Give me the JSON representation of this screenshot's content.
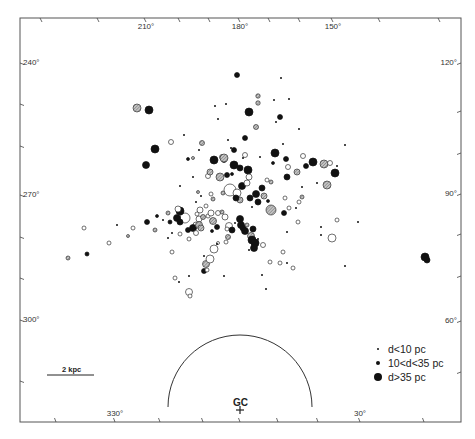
{
  "chart_data": {
    "type": "scatter",
    "title": "",
    "frame": {
      "left": 20,
      "top": 18,
      "right": 461,
      "bottom": 422
    },
    "axis_labels": {
      "top": [
        {
          "text": "210°",
          "x": 146
        },
        {
          "text": "180°",
          "x": 240
        },
        {
          "text": "150°",
          "x": 333
        }
      ],
      "bottom": [
        {
          "text": "330°",
          "x": 115
        },
        {
          "text": "30°",
          "x": 360
        }
      ],
      "left": [
        {
          "text": "240°",
          "y": 63
        },
        {
          "text": "270°",
          "y": 195
        },
        {
          "text": "300°",
          "y": 320
        }
      ],
      "right": [
        {
          "text": "120°",
          "y": 63
        },
        {
          "text": "90°",
          "y": 194
        },
        {
          "text": "60°",
          "y": 321
        }
      ]
    },
    "ticks": {
      "top": [
        42,
        99,
        146,
        180,
        210,
        240,
        270,
        300,
        333,
        380,
        440
      ],
      "bottom": [
        56,
        115,
        160,
        203,
        240,
        278,
        318,
        360,
        424
      ],
      "left": [
        63,
        104,
        146,
        195,
        237,
        278,
        320,
        381
      ],
      "right": [
        63,
        111,
        153,
        194,
        234,
        276,
        321,
        372
      ]
    },
    "legend": {
      "position": "lower-right",
      "entries": [
        {
          "marker": "tiny-dot",
          "label": "d<10 pc"
        },
        {
          "marker": "small-dot",
          "label": "10<d<35 pc"
        },
        {
          "marker": "large-dot",
          "label": "d>35 pc"
        }
      ]
    },
    "scale_bar": {
      "label": "2 kpc",
      "x1": 47,
      "x2": 94,
      "y": 375
    },
    "galactic_centre": {
      "label": "GC",
      "x": 240,
      "y": 410,
      "arc_radius": 72
    },
    "marker_styles": {
      "solid": "#111111",
      "hatched": "#a8a8a8",
      "open": "#ffffff"
    },
    "points": [
      {
        "x": 237,
        "y": 75,
        "r": 2.5,
        "s": "solid"
      },
      {
        "x": 281,
        "y": 78,
        "r": 1,
        "s": "solid"
      },
      {
        "x": 258,
        "y": 96,
        "r": 2.2,
        "s": "hatched"
      },
      {
        "x": 258,
        "y": 103,
        "r": 2.2,
        "s": "hatched"
      },
      {
        "x": 137,
        "y": 108,
        "r": 4,
        "s": "hatched"
      },
      {
        "x": 149,
        "y": 110,
        "r": 4,
        "s": "solid"
      },
      {
        "x": 215,
        "y": 106,
        "r": 1,
        "s": "solid"
      },
      {
        "x": 226,
        "y": 104,
        "r": 1,
        "s": "solid"
      },
      {
        "x": 274,
        "y": 100,
        "r": 1,
        "s": "solid"
      },
      {
        "x": 289,
        "y": 99,
        "r": 1,
        "s": "solid"
      },
      {
        "x": 249,
        "y": 112,
        "r": 4,
        "s": "solid"
      },
      {
        "x": 218,
        "y": 119,
        "r": 1,
        "s": "solid"
      },
      {
        "x": 280,
        "y": 117,
        "r": 2.5,
        "s": "solid"
      },
      {
        "x": 276,
        "y": 122,
        "r": 1,
        "s": "solid"
      },
      {
        "x": 256,
        "y": 127,
        "r": 2.5,
        "s": "hatched"
      },
      {
        "x": 299,
        "y": 129,
        "r": 1,
        "s": "solid"
      },
      {
        "x": 184,
        "y": 135,
        "r": 1,
        "s": "solid"
      },
      {
        "x": 245,
        "y": 138,
        "r": 2.5,
        "s": "solid"
      },
      {
        "x": 171,
        "y": 142,
        "r": 2.5,
        "s": "open"
      },
      {
        "x": 202,
        "y": 143,
        "r": 2.5,
        "s": "hatched"
      },
      {
        "x": 155,
        "y": 149,
        "r": 4,
        "s": "solid"
      },
      {
        "x": 283,
        "y": 144,
        "r": 1,
        "s": "solid"
      },
      {
        "x": 228,
        "y": 140,
        "r": 1,
        "s": "solid"
      },
      {
        "x": 231,
        "y": 148,
        "r": 1,
        "s": "solid"
      },
      {
        "x": 234,
        "y": 150,
        "r": 2.5,
        "s": "solid"
      },
      {
        "x": 199,
        "y": 150,
        "r": 1,
        "s": "solid"
      },
      {
        "x": 193,
        "y": 158,
        "r": 1.5,
        "s": "hatched"
      },
      {
        "x": 224,
        "y": 160,
        "r": 2.5,
        "s": "solid"
      },
      {
        "x": 222,
        "y": 157,
        "r": 2.5,
        "s": "open"
      },
      {
        "x": 224,
        "y": 158,
        "r": 4,
        "s": "hatched"
      },
      {
        "x": 214,
        "y": 160,
        "r": 4,
        "s": "solid"
      },
      {
        "x": 245,
        "y": 155,
        "r": 2.5,
        "s": "open"
      },
      {
        "x": 243,
        "y": 158,
        "r": 1,
        "s": "solid"
      },
      {
        "x": 275,
        "y": 153,
        "r": 4,
        "s": "solid"
      },
      {
        "x": 286,
        "y": 159,
        "r": 2.5,
        "s": "solid"
      },
      {
        "x": 273,
        "y": 163,
        "r": 1.5,
        "s": "solid"
      },
      {
        "x": 260,
        "y": 157,
        "r": 1,
        "s": "solid"
      },
      {
        "x": 313,
        "y": 162,
        "r": 4,
        "s": "solid"
      },
      {
        "x": 324,
        "y": 164,
        "r": 4,
        "s": "hatched"
      },
      {
        "x": 146,
        "y": 165,
        "r": 3.5,
        "s": "solid"
      },
      {
        "x": 188,
        "y": 159,
        "r": 1.5,
        "s": "solid"
      },
      {
        "x": 220,
        "y": 177,
        "r": 4,
        "s": "hatched"
      },
      {
        "x": 227,
        "y": 175,
        "r": 2.5,
        "s": "solid"
      },
      {
        "x": 208,
        "y": 176,
        "r": 2.5,
        "s": "open"
      },
      {
        "x": 210,
        "y": 172,
        "r": 3,
        "s": "hatched"
      },
      {
        "x": 232,
        "y": 174,
        "r": 1.5,
        "s": "solid"
      },
      {
        "x": 234,
        "y": 165,
        "r": 4,
        "s": "solid"
      },
      {
        "x": 248,
        "y": 170,
        "r": 4,
        "s": "solid"
      },
      {
        "x": 240,
        "y": 168,
        "r": 3,
        "s": "solid"
      },
      {
        "x": 249,
        "y": 177,
        "r": 3,
        "s": "open"
      },
      {
        "x": 267,
        "y": 180,
        "r": 2,
        "s": "open"
      },
      {
        "x": 271,
        "y": 182,
        "r": 2,
        "s": "hatched"
      },
      {
        "x": 288,
        "y": 167,
        "r": 2.5,
        "s": "open"
      },
      {
        "x": 297,
        "y": 172,
        "r": 3,
        "s": "hatched"
      },
      {
        "x": 287,
        "y": 177,
        "r": 3,
        "s": "solid"
      },
      {
        "x": 303,
        "y": 156,
        "r": 2.5,
        "s": "open"
      },
      {
        "x": 306,
        "y": 166,
        "r": 2.5,
        "s": "solid"
      },
      {
        "x": 330,
        "y": 163,
        "r": 2.5,
        "s": "open"
      },
      {
        "x": 337,
        "y": 166,
        "r": 1,
        "s": "solid"
      },
      {
        "x": 335,
        "y": 173,
        "r": 4,
        "s": "solid"
      },
      {
        "x": 345,
        "y": 145,
        "r": 1,
        "s": "solid"
      },
      {
        "x": 327,
        "y": 185,
        "r": 4,
        "s": "hatched"
      },
      {
        "x": 317,
        "y": 183,
        "r": 1,
        "s": "solid"
      },
      {
        "x": 230,
        "y": 190,
        "r": 6,
        "s": "open"
      },
      {
        "x": 237,
        "y": 193,
        "r": 4,
        "s": "open"
      },
      {
        "x": 242,
        "y": 186,
        "r": 3.5,
        "s": "solid"
      },
      {
        "x": 247,
        "y": 183,
        "r": 3,
        "s": "open"
      },
      {
        "x": 240,
        "y": 200,
        "r": 3,
        "s": "hatched"
      },
      {
        "x": 236,
        "y": 198,
        "r": 3,
        "s": "solid"
      },
      {
        "x": 250,
        "y": 198,
        "r": 3,
        "s": "solid"
      },
      {
        "x": 256,
        "y": 194,
        "r": 3.5,
        "s": "solid"
      },
      {
        "x": 258,
        "y": 202,
        "r": 3,
        "s": "solid"
      },
      {
        "x": 262,
        "y": 188,
        "r": 3,
        "s": "solid"
      },
      {
        "x": 264,
        "y": 196,
        "r": 3,
        "s": "hatched"
      },
      {
        "x": 268,
        "y": 201,
        "r": 1.5,
        "s": "solid"
      },
      {
        "x": 271,
        "y": 210,
        "r": 5,
        "s": "hatched"
      },
      {
        "x": 252,
        "y": 207,
        "r": 1,
        "s": "solid"
      },
      {
        "x": 223,
        "y": 193,
        "r": 2,
        "s": "hatched"
      },
      {
        "x": 211,
        "y": 194,
        "r": 2,
        "s": "open"
      },
      {
        "x": 213,
        "y": 199,
        "r": 2,
        "s": "hatched"
      },
      {
        "x": 198,
        "y": 192,
        "r": 1.5,
        "s": "hatched"
      },
      {
        "x": 201,
        "y": 196,
        "r": 1,
        "s": "solid"
      },
      {
        "x": 200,
        "y": 210,
        "r": 3,
        "s": "open"
      },
      {
        "x": 206,
        "y": 206,
        "r": 2,
        "s": "open"
      },
      {
        "x": 285,
        "y": 198,
        "r": 2,
        "s": "open"
      },
      {
        "x": 289,
        "y": 208,
        "r": 2,
        "s": "open"
      },
      {
        "x": 284,
        "y": 213,
        "r": 2.5,
        "s": "solid"
      },
      {
        "x": 296,
        "y": 208,
        "r": 1,
        "s": "solid"
      },
      {
        "x": 302,
        "y": 187,
        "r": 1,
        "s": "solid"
      },
      {
        "x": 302,
        "y": 197,
        "r": 2,
        "s": "hatched"
      },
      {
        "x": 299,
        "y": 202,
        "r": 2,
        "s": "open"
      },
      {
        "x": 196,
        "y": 225,
        "r": 3,
        "s": "open"
      },
      {
        "x": 185,
        "y": 218,
        "r": 5,
        "s": "open"
      },
      {
        "x": 180,
        "y": 211,
        "r": 4,
        "s": "solid"
      },
      {
        "x": 178,
        "y": 209,
        "r": 3,
        "s": "open"
      },
      {
        "x": 177,
        "y": 218,
        "r": 3.5,
        "s": "solid"
      },
      {
        "x": 180,
        "y": 222,
        "r": 3,
        "s": "solid"
      },
      {
        "x": 188,
        "y": 230,
        "r": 2.5,
        "s": "solid"
      },
      {
        "x": 193,
        "y": 228,
        "r": 3.5,
        "s": "solid"
      },
      {
        "x": 197,
        "y": 214,
        "r": 2,
        "s": "open"
      },
      {
        "x": 199,
        "y": 219,
        "r": 3,
        "s": "open"
      },
      {
        "x": 203,
        "y": 217,
        "r": 2.5,
        "s": "hatched"
      },
      {
        "x": 199,
        "y": 225,
        "r": 3.5,
        "s": "hatched"
      },
      {
        "x": 201,
        "y": 228,
        "r": 3,
        "s": "hatched"
      },
      {
        "x": 196,
        "y": 233,
        "r": 2.5,
        "s": "open"
      },
      {
        "x": 208,
        "y": 216,
        "r": 2,
        "s": "open"
      },
      {
        "x": 211,
        "y": 213,
        "r": 3,
        "s": "open"
      },
      {
        "x": 213,
        "y": 221,
        "r": 3.5,
        "s": "hatched"
      },
      {
        "x": 218,
        "y": 213,
        "r": 2.5,
        "s": "open"
      },
      {
        "x": 222,
        "y": 212,
        "r": 2,
        "s": "hatched"
      },
      {
        "x": 217,
        "y": 227,
        "r": 2.5,
        "s": "solid"
      },
      {
        "x": 225,
        "y": 217,
        "r": 3,
        "s": "open"
      },
      {
        "x": 212,
        "y": 231,
        "r": 1.5,
        "s": "solid"
      },
      {
        "x": 229,
        "y": 226,
        "r": 3.5,
        "s": "open"
      },
      {
        "x": 232,
        "y": 230,
        "r": 3,
        "s": "solid"
      },
      {
        "x": 227,
        "y": 229,
        "r": 2,
        "s": "open"
      },
      {
        "x": 235,
        "y": 223,
        "r": 1,
        "s": "solid"
      },
      {
        "x": 240,
        "y": 219,
        "r": 3.5,
        "s": "solid"
      },
      {
        "x": 241,
        "y": 225,
        "r": 3.5,
        "s": "solid"
      },
      {
        "x": 243,
        "y": 228,
        "r": 3,
        "s": "solid"
      },
      {
        "x": 245,
        "y": 231,
        "r": 3.5,
        "s": "solid"
      },
      {
        "x": 247,
        "y": 225,
        "r": 2,
        "s": "hatched"
      },
      {
        "x": 253,
        "y": 229,
        "r": 3,
        "s": "solid"
      },
      {
        "x": 251,
        "y": 236,
        "r": 3.5,
        "s": "hatched"
      },
      {
        "x": 252,
        "y": 240,
        "r": 4,
        "s": "solid"
      },
      {
        "x": 255,
        "y": 243,
        "r": 4,
        "s": "solid"
      },
      {
        "x": 254,
        "y": 248,
        "r": 3.5,
        "s": "solid"
      },
      {
        "x": 258,
        "y": 239,
        "r": 1,
        "s": "solid"
      },
      {
        "x": 263,
        "y": 245,
        "r": 2.5,
        "s": "open"
      },
      {
        "x": 249,
        "y": 250,
        "r": 1,
        "s": "solid"
      },
      {
        "x": 228,
        "y": 237,
        "r": 2.5,
        "s": "hatched"
      },
      {
        "x": 226,
        "y": 242,
        "r": 2,
        "s": "open"
      },
      {
        "x": 218,
        "y": 243,
        "r": 1.5,
        "s": "open"
      },
      {
        "x": 214,
        "y": 249,
        "r": 4,
        "s": "open"
      },
      {
        "x": 189,
        "y": 239,
        "r": 2,
        "s": "open"
      },
      {
        "x": 170,
        "y": 222,
        "r": 2,
        "s": "solid"
      },
      {
        "x": 168,
        "y": 213,
        "r": 2,
        "s": "hatched"
      },
      {
        "x": 163,
        "y": 220,
        "r": 1,
        "s": "solid"
      },
      {
        "x": 155,
        "y": 230,
        "r": 2,
        "s": "hatched"
      },
      {
        "x": 147,
        "y": 222,
        "r": 2.5,
        "s": "solid"
      },
      {
        "x": 157,
        "y": 216,
        "r": 1.5,
        "s": "solid"
      },
      {
        "x": 172,
        "y": 233,
        "r": 1,
        "s": "solid"
      },
      {
        "x": 180,
        "y": 234,
        "r": 2,
        "s": "open"
      },
      {
        "x": 168,
        "y": 238,
        "r": 1,
        "s": "solid"
      },
      {
        "x": 172,
        "y": 252,
        "r": 2,
        "s": "open"
      },
      {
        "x": 206,
        "y": 264,
        "r": 3.5,
        "s": "hatched"
      },
      {
        "x": 204,
        "y": 256,
        "r": 1,
        "s": "solid"
      },
      {
        "x": 210,
        "y": 259,
        "r": 4,
        "s": "open"
      },
      {
        "x": 204,
        "y": 271,
        "r": 2.5,
        "s": "solid"
      },
      {
        "x": 207,
        "y": 270,
        "r": 2,
        "s": "open"
      },
      {
        "x": 175,
        "y": 278,
        "r": 2,
        "s": "open"
      },
      {
        "x": 179,
        "y": 282,
        "r": 1,
        "s": "solid"
      },
      {
        "x": 189,
        "y": 292,
        "r": 3.5,
        "s": "open"
      },
      {
        "x": 190,
        "y": 296,
        "r": 2,
        "s": "open"
      },
      {
        "x": 189,
        "y": 276,
        "r": 1,
        "s": "solid"
      },
      {
        "x": 224,
        "y": 276,
        "r": 1,
        "s": "solid"
      },
      {
        "x": 262,
        "y": 275,
        "r": 1,
        "s": "solid"
      },
      {
        "x": 270,
        "y": 262,
        "r": 2,
        "s": "open"
      },
      {
        "x": 280,
        "y": 263,
        "r": 2,
        "s": "open"
      },
      {
        "x": 293,
        "y": 268,
        "r": 2,
        "s": "open"
      },
      {
        "x": 266,
        "y": 289,
        "r": 1,
        "s": "solid"
      },
      {
        "x": 287,
        "y": 232,
        "r": 1,
        "s": "solid"
      },
      {
        "x": 298,
        "y": 222,
        "r": 2,
        "s": "open"
      },
      {
        "x": 321,
        "y": 227,
        "r": 1,
        "s": "solid"
      },
      {
        "x": 337,
        "y": 220,
        "r": 2,
        "s": "open"
      },
      {
        "x": 358,
        "y": 222,
        "r": 1,
        "s": "solid"
      },
      {
        "x": 321,
        "y": 235,
        "r": 1,
        "s": "solid"
      },
      {
        "x": 332,
        "y": 238,
        "r": 4,
        "s": "open"
      },
      {
        "x": 345,
        "y": 266,
        "r": 1,
        "s": "solid"
      },
      {
        "x": 425,
        "y": 257,
        "r": 4,
        "s": "solid"
      },
      {
        "x": 427,
        "y": 260,
        "r": 3,
        "s": "solid"
      },
      {
        "x": 287,
        "y": 263,
        "r": 1,
        "s": "solid"
      },
      {
        "x": 283,
        "y": 252,
        "r": 2,
        "s": "open"
      },
      {
        "x": 133,
        "y": 228,
        "r": 2,
        "s": "open"
      },
      {
        "x": 128,
        "y": 236,
        "r": 1.5,
        "s": "hatched"
      },
      {
        "x": 117,
        "y": 225,
        "r": 1,
        "s": "solid"
      },
      {
        "x": 109,
        "y": 243,
        "r": 2,
        "s": "open"
      },
      {
        "x": 87,
        "y": 254,
        "r": 2,
        "s": "solid"
      },
      {
        "x": 84,
        "y": 228,
        "r": 2,
        "s": "open"
      },
      {
        "x": 68,
        "y": 258,
        "r": 2,
        "s": "hatched"
      },
      {
        "x": 193,
        "y": 177,
        "r": 1,
        "s": "solid"
      },
      {
        "x": 180,
        "y": 186,
        "r": 1,
        "s": "solid"
      },
      {
        "x": 217,
        "y": 244,
        "r": 1,
        "s": "solid"
      },
      {
        "x": 196,
        "y": 202,
        "r": 1,
        "s": "solid"
      }
    ]
  }
}
